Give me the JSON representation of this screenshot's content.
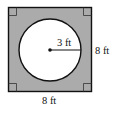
{
  "figure": {
    "shape": "square-with-inscribed-circle",
    "colors": {
      "shaded": "#ababab",
      "stroke": "#111111",
      "circle_fill": "#ffffff"
    },
    "labels": {
      "radius": "3 ft",
      "right_side": "8 ft",
      "bottom_side": "8 ft"
    },
    "right_angle_markers": 4
  }
}
